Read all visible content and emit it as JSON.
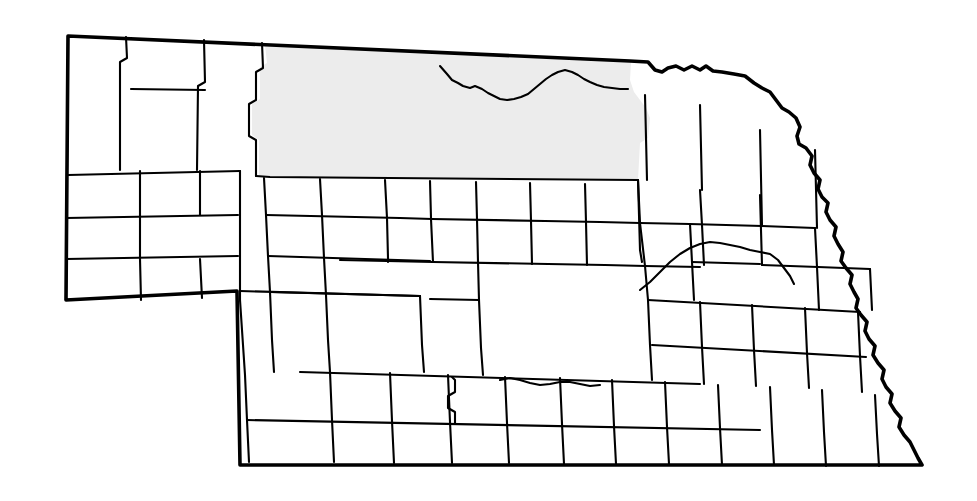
{
  "map": {
    "title": "Nebraska county map",
    "state_name": "Nebraska",
    "description": "Outline map of Nebraska showing all county boundaries, with a group of north-central counties shaded.",
    "canvas": {
      "width": 977,
      "height": 501
    },
    "colors": {
      "background": "#ffffff",
      "county_fill": "#ffffff",
      "highlight_fill": "#ececec",
      "county_border": "#000000",
      "state_border": "#000000"
    },
    "legend": {
      "highlight_label": "Highlighted counties",
      "plain_label": "Other counties"
    },
    "counts": {
      "highlighted_counties": 4,
      "highlight_region_label": "North-central Nebraska"
    },
    "highlighted_counties": [
      {
        "name": "Cherry",
        "position": "northwest of highlight block"
      },
      {
        "name": "Keya Paha",
        "position": "north of Niobrara River"
      },
      {
        "name": "Brown",
        "position": "south of Keya Paha, west"
      },
      {
        "name": "Rock",
        "position": "south of Keya Paha, east"
      },
      {
        "name": "Boyd",
        "position": "northeast of highlight block"
      }
    ],
    "features": {
      "north_border": "South Dakota state line",
      "east_border": "Missouri River",
      "south_border": "Kansas state line",
      "west_border": "Wyoming and Colorado state lines",
      "interior_river_north": "Niobrara River",
      "interior_river_east": "Platte River"
    },
    "state_outline_path": "M 68,36 L 630,61 L 648,62 L 655,70 L 662,72 L 668,68 L 676,66 L 684,70 L 692,66 L 700,70 L 706,66 L 713,71 L 722,72 L 734,74 L 745,76 L 754,83 L 762,88 L 770,92 L 776,100 L 782,108 L 789,112 L 796,118 L 800,127 L 797,136 L 799,144 L 806,148 L 812,156 L 810,165 L 814,173 L 820,180 L 818,189 L 822,197 L 828,203 L 826,212 L 830,220 L 836,227 L 834,236 L 838,244 L 843,252 L 841,261 L 846,268 L 852,275 L 850,284 L 854,292 L 858,299 L 856,308 L 861,315 L 867,322 L 865,331 L 869,339 L 875,346 L 873,355 L 878,363 L 884,370 L 882,379 L 886,387 L 892,394 L 890,403 L 895,411 L 901,418 L 899,427 L 904,435 L 910,442 L 914,450 L 918,458 L 922,465 L 240,465 L 237,291 L 66,300 Z",
    "county_lines_paths": [
      "M 68,36 L 66,300",
      "M 68,175 L 240,171",
      "M 66,218 L 238,215",
      "M 66,259 L 238,256",
      "M 126,37 L 127,58 L 120,62 L 120,170",
      "M 204,40 L 205,82 L 198,86 L 197,170",
      "M 131,89 L 205,90",
      "M 262,43 L 263,68 L 256,72 L 256,100 L 249,104 L 249,136 L 256,140 L 256,176",
      "M 200,171 L 200,215",
      "M 200,259 L 202,298",
      "M 140,171 L 140,215",
      "M 140,215 L 140,259",
      "M 140,259 L 141,300",
      "M 240,171 L 240,300",
      "M 240,291 L 420,296",
      "M 256,176 L 270,177 L 638,180",
      "M 264,178 L 266,215",
      "M 266,215 L 268,256",
      "M 268,256 L 270,292",
      "M 320,179 L 322,215",
      "M 322,215 L 324,258",
      "M 324,258 L 326,295",
      "M 266,215 L 400,218",
      "M 268,256 L 430,261",
      "M 385,180 L 387,218",
      "M 387,218 L 388,258",
      "M 388,258 L 388,262",
      "M 430,181 L 431,218",
      "M 400,218 L 432,219",
      "M 431,219 L 433,262",
      "M 433,262 L 340,260",
      "M 476,182 L 477,219",
      "M 477,219 L 478,262",
      "M 478,262 L 479,300",
      "M 432,219 L 545,221",
      "M 433,262 L 548,264",
      "M 530,183 L 531,221",
      "M 531,221 L 532,264",
      "M 545,221 L 600,222",
      "M 548,264 L 605,265",
      "M 585,184 L 586,222",
      "M 586,222 L 587,265",
      "M 600,222 L 640,223",
      "M 605,265 L 645,266",
      "M 638,180 L 640,223",
      "M 640,223 L 645,266",
      "M 645,266 L 648,300",
      "M 479,300 L 430,299",
      "M 270,292 L 420,296",
      "M 326,295 L 328,340",
      "M 328,340 L 330,372",
      "M 420,296 L 422,345",
      "M 422,345 L 424,372",
      "M 479,300 L 481,348",
      "M 481,348 L 483,375",
      "M 240,300 L 245,375",
      "M 245,375 L 247,420",
      "M 247,420 L 249,462",
      "M 270,292 L 272,340",
      "M 272,340 L 274,372",
      "M 300,372 L 700,384",
      "M 247,420 L 760,430",
      "M 330,372 L 332,420",
      "M 332,420 L 334,462",
      "M 390,373 L 392,421",
      "M 392,421 L 394,463",
      "M 448,375 L 450,422",
      "M 450,422 L 452,463",
      "M 452,377 L 455,380 L 455,392 L 448,396 L 448,408 L 455,412 L 455,424",
      "M 505,377 L 507,423",
      "M 507,423 L 509,463",
      "M 560,378 L 562,424",
      "M 562,424 L 564,464",
      "M 612,380 L 614,426",
      "M 614,426 L 616,464",
      "M 665,382 L 667,427",
      "M 667,427 L 669,464",
      "M 718,385 L 720,428",
      "M 720,428 L 722,465",
      "M 770,387 L 772,430",
      "M 772,430 L 774,465",
      "M 822,390 L 824,432",
      "M 824,432 L 826,466",
      "M 875,395 L 877,434",
      "M 877,434 L 879,466",
      "M 648,300 L 650,345",
      "M 650,345 L 652,380",
      "M 700,302 L 702,347",
      "M 702,347 L 704,384",
      "M 752,305 L 754,350",
      "M 754,350 L 756,386",
      "M 805,308 L 807,353",
      "M 807,353 L 809,388",
      "M 858,312 L 860,356",
      "M 860,356 L 862,392",
      "M 648,300 L 860,312",
      "M 652,345 L 866,357",
      "M 638,180 L 640,250",
      "M 640,250 L 642,262",
      "M 640,223 L 690,224",
      "M 690,224 L 692,262",
      "M 692,262 L 694,300",
      "M 645,266 L 700,267",
      "M 692,262 L 760,264",
      "M 760,195 L 762,265",
      "M 700,190 L 702,225",
      "M 702,225 L 704,265",
      "M 690,224 L 762,226",
      "M 762,226 L 815,228",
      "M 815,228 L 817,267",
      "M 762,265 L 818,267",
      "M 818,267 L 870,269",
      "M 870,269 L 872,310",
      "M 817,267 L 819,310",
      "M 815,150 L 817,228",
      "M 760,130 L 762,226",
      "M 700,105 L 702,190",
      "M 645,95 L 647,180"
    ],
    "river_paths": [
      "M 440,66 L 447,74 L 452,80 L 458,83 L 463,86 L 470,88 L 475,86 L 482,89 L 488,93 L 494,96 L 500,99 L 507,100 L 514,99 L 521,97 L 528,94 L 534,89 L 540,84 L 546,79 L 552,75 L 558,72 L 565,70 L 572,72 L 578,75 L 584,79 L 590,82 L 597,85 L 604,87 L 612,88 L 620,89 L 628,89",
      "M 640,290 L 650,282 L 660,272 L 670,262 L 680,254 L 690,248 L 700,244 L 710,242 L 720,243 L 730,245 L 740,247 L 750,250 L 760,252 L 770,254 L 778,260 L 784,268 L 790,276 L 794,284",
      "M 500,380 L 510,378 L 520,380 L 530,383 L 540,385 L 550,384 L 560,382 L 570,382 L 580,384 L 590,386 L 600,385"
    ],
    "highlight_region_path": "M 265,45 L 267,63 L 260,67 L 260,99 L 252,104 L 252,135 L 259,140 L 259,176 L 638,180 L 640,143 L 648,138 L 650,118 L 646,108 L 640,100 L 634,92 L 630,80 L 631,62 Z"
  }
}
